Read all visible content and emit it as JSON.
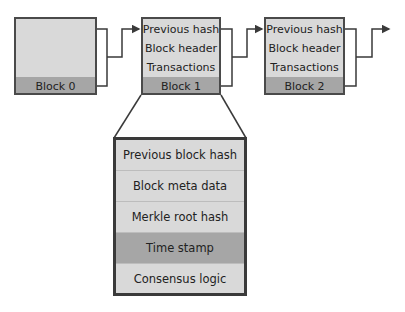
{
  "diagram": {
    "blocks": [
      {
        "label": "Block 0",
        "rows": []
      },
      {
        "label": "Block 1",
        "rows": [
          "Previous hash",
          "Block header",
          "Transactions"
        ]
      },
      {
        "label": "Block 2",
        "rows": [
          "Previous hash",
          "Block header",
          "Transactions"
        ]
      }
    ],
    "expanded_header": {
      "source": "Block 1",
      "rows": [
        {
          "label": "Previous block hash",
          "highlight": false
        },
        {
          "label": "Block meta data",
          "highlight": false
        },
        {
          "label": "Merkle root hash",
          "highlight": false
        },
        {
          "label": "Time stamp",
          "highlight": true
        },
        {
          "label": "Consensus logic",
          "highlight": false
        }
      ]
    },
    "colors": {
      "block_fill": "#d9d9d9",
      "block_band": "#a6a6a6",
      "border": "#4a4a4a",
      "connector": "#3a3a3a"
    }
  }
}
